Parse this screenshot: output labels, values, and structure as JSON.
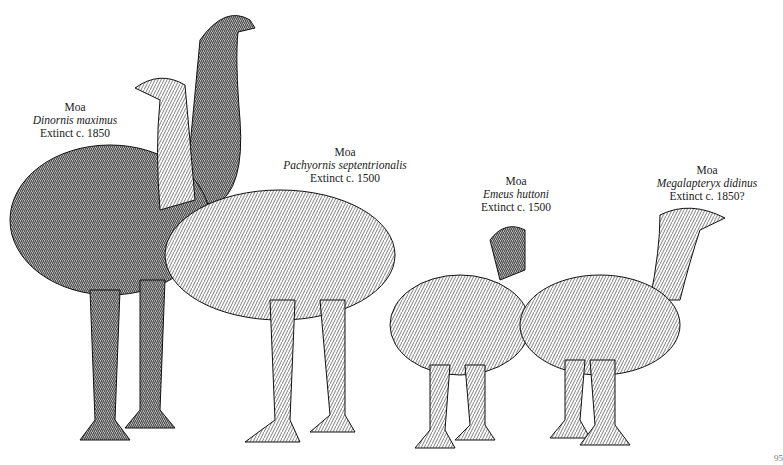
{
  "illustration": {
    "subject": "Four moa species drawn side by side",
    "page_number": "95"
  },
  "birds": [
    {
      "common": "Moa",
      "species": "Dinornis maximus",
      "extinct": "Extinct c. 1850"
    },
    {
      "common": "Moa",
      "species": "Pachyornis septentrionalis",
      "extinct": "Extinct c. 1500"
    },
    {
      "common": "Moa",
      "species": "Emeus huttoni",
      "extinct": "Extinct c. 1500"
    },
    {
      "common": "Moa",
      "species": "Megalapteryx didinus",
      "extinct": "Extinct c. 1850?"
    }
  ]
}
